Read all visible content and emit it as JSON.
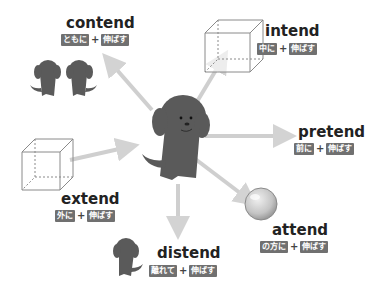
{
  "colors": {
    "badge_bg": "#707070",
    "badge_text": "#ffffff",
    "word_text": "#222222",
    "arrow": "#cfcfcf",
    "dog": "#5a5a5a",
    "cube_line": "#888888",
    "ball": "#c8c8c8"
  },
  "center": {
    "icon": "dog-icon",
    "label": ""
  },
  "words": [
    {
      "id": "contend",
      "word": "contend",
      "prefix_meaning": "ともに",
      "plus": "+",
      "root_meaning": "伸ばす",
      "icon": "two-dogs-icon"
    },
    {
      "id": "intend",
      "word": "intend",
      "prefix_meaning": "中に",
      "plus": "+",
      "root_meaning": "伸ばす",
      "icon": "cube-icon"
    },
    {
      "id": "pretend",
      "word": "pretend",
      "prefix_meaning": "前に",
      "plus": "+",
      "root_meaning": "伸ばす",
      "icon": "arrow-right-icon"
    },
    {
      "id": "extend",
      "word": "extend",
      "prefix_meaning": "外に",
      "plus": "+",
      "root_meaning": "伸ばす",
      "icon": "cube-icon"
    },
    {
      "id": "attend",
      "word": "attend",
      "prefix_meaning": "の方に",
      "plus": "+",
      "root_meaning": "伸ばす",
      "icon": "ball-icon"
    },
    {
      "id": "distend",
      "word": "distend",
      "prefix_meaning": "離れて",
      "plus": "+",
      "root_meaning": "伸ばす",
      "icon": "small-dog-icon"
    }
  ]
}
